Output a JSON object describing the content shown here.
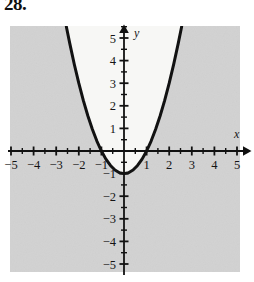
{
  "figure": {
    "problem_number": "28.",
    "background_color": "#ffffff",
    "plot_region_color": "#d2d2d2",
    "unshaded_region_color": "#f7f7f5",
    "curve_color": "#121212",
    "axis_color": "#111111"
  },
  "axes": {
    "x_axis_label": "x",
    "y_axis_label": "y",
    "x_ticks_labeled": [
      "-5",
      "-4",
      "-3",
      "-2",
      "-1",
      "1",
      "2",
      "3",
      "4",
      "5"
    ],
    "y_ticks_labeled": [
      "5",
      "4",
      "3",
      "2",
      "1",
      "-1",
      "-2",
      "-3",
      "-4",
      "-5"
    ]
  },
  "chart_data": {
    "type": "line",
    "title": "",
    "subtitle": "",
    "xlabel": "x",
    "ylabel": "y",
    "xlim": [
      -5.6,
      5.6
    ],
    "ylim": [
      -5.6,
      5.6
    ],
    "grid": false,
    "legend": "none",
    "x_ticks": [
      -5,
      -4,
      -3,
      -2,
      -1,
      0,
      1,
      2,
      3,
      4,
      5
    ],
    "y_ticks": [
      -5,
      -4,
      -3,
      -2,
      -1,
      0,
      1,
      2,
      3,
      4,
      5
    ],
    "x_minor_tick_step": 0.5,
    "y_minor_tick_step": 0.5,
    "series": [
      {
        "name": "y = x^2 - 1",
        "equation": "y = x^2 - 1",
        "vertex": [
          0,
          -1
        ],
        "x_intercepts": [
          -1,
          1
        ],
        "y_intercept": -1,
        "line_width": 3,
        "color": "#121212",
        "x": [
          -2.55,
          -2.4,
          -2.2,
          -2.0,
          -1.8,
          -1.6,
          -1.4,
          -1.2,
          -1.0,
          -0.8,
          -0.6,
          -0.4,
          -0.2,
          0.0,
          0.2,
          0.4,
          0.6,
          0.8,
          1.0,
          1.2,
          1.4,
          1.6,
          1.8,
          2.0,
          2.2,
          2.4,
          2.55
        ],
        "values": [
          5.5,
          4.76,
          3.84,
          3.0,
          2.24,
          1.56,
          0.96,
          0.44,
          0.0,
          -0.36,
          -0.64,
          -0.84,
          -0.96,
          -1.0,
          -0.96,
          -0.84,
          -0.64,
          -0.36,
          0.0,
          0.44,
          0.96,
          1.56,
          2.24,
          3.0,
          3.84,
          4.76,
          5.5
        ]
      }
    ],
    "shaded_region": {
      "description": "region outside (below/left/right of) the parabola is shaded gray; interior of parabola is white",
      "inequality": "y < x^2 - 1",
      "fill": "#d2d2d2",
      "interior_fill": "#f7f7f5"
    }
  }
}
